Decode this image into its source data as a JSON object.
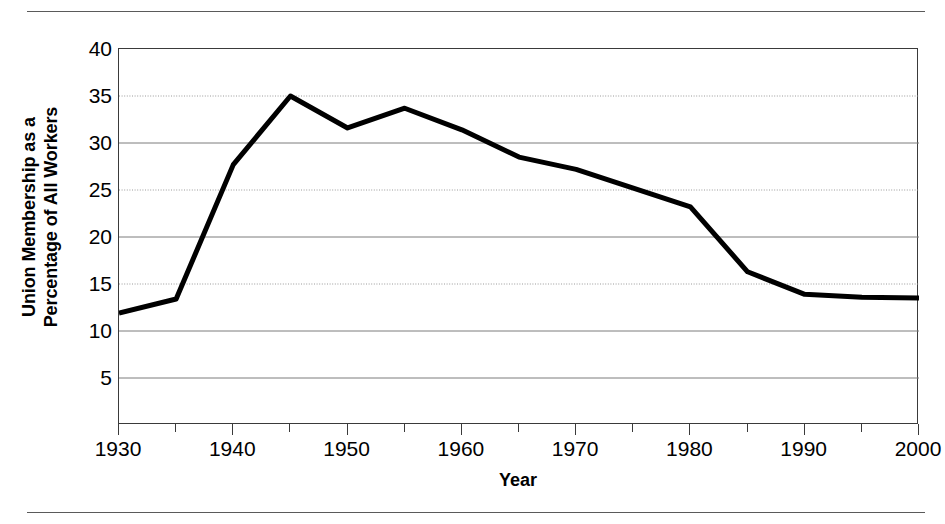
{
  "chart_data": {
    "type": "line",
    "title": "",
    "xlabel": "Year",
    "ylabel": "Union Membership as a Percentage of All Workers",
    "ylabel_line1": "Union Membership as a",
    "ylabel_line2": "Percentage of All Workers",
    "xlim": [
      1930,
      2000
    ],
    "ylim": [
      0,
      40
    ],
    "grid": true,
    "legend": "none",
    "x_tick_step": 5,
    "x_tick_label_step": 10,
    "x_ticks": [
      1930,
      1935,
      1940,
      1945,
      1950,
      1955,
      1960,
      1965,
      1970,
      1975,
      1980,
      1985,
      1990,
      1995,
      2000
    ],
    "x_tick_labels": [
      "1930",
      "1940",
      "1950",
      "1960",
      "1970",
      "1980",
      "1990",
      "2000"
    ],
    "x_tick_label_values": [
      1930,
      1940,
      1950,
      1960,
      1970,
      1980,
      1990,
      2000
    ],
    "y_ticks": [
      5,
      10,
      15,
      20,
      25,
      30,
      35,
      40
    ],
    "y_tick_labels": [
      "5",
      "10",
      "15",
      "20",
      "25",
      "30",
      "35",
      "40"
    ],
    "gridline_styles": {
      "5": "solid",
      "10": "solid",
      "15": "dotted",
      "20": "solid",
      "25": "dotted",
      "30": "solid",
      "35": "dotted",
      "40": "frame"
    },
    "series": [
      {
        "name": "Union membership",
        "color": "#000000",
        "line_width": 5,
        "x": [
          1930,
          1935,
          1940,
          1945,
          1950,
          1955,
          1960,
          1965,
          1970,
          1975,
          1980,
          1985,
          1990,
          1995,
          2000
        ],
        "values": [
          11.9,
          13.4,
          27.7,
          35.0,
          31.6,
          33.7,
          31.4,
          28.5,
          27.2,
          25.2,
          23.2,
          16.3,
          13.9,
          13.6,
          13.5
        ]
      }
    ],
    "annotations": []
  },
  "figure": {
    "background_color": "#ffffff",
    "frame_color": "#3a3a3a",
    "rule_color": "#5a5a5a",
    "top_rule": "horizontal-rule",
    "bottom_rule": "horizontal-rule"
  }
}
